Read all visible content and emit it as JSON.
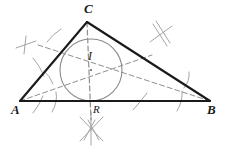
{
  "figure": {
    "background_color": "#ffffff"
  },
  "labels": {
    "vertex_a": "A",
    "vertex_b": "B",
    "vertex_c": "C",
    "incenter": "I",
    "foot_point": "R"
  },
  "colors": {
    "triangle_stroke": "#1a1a1a",
    "circle_stroke": "#8a8a8a",
    "bisector_stroke": "#8f8f8f",
    "construction_stroke": "#9a9a9a",
    "label_color": "#1a1a1a"
  },
  "geometry": {
    "points": {
      "A": [
        20,
        101
      ],
      "B": [
        210,
        101
      ],
      "C": [
        87,
        22
      ],
      "I": [
        91,
        70
      ],
      "R": [
        91,
        101
      ]
    },
    "incircle": {
      "center": [
        91,
        70
      ],
      "radius": 31
    },
    "bisectors": [
      {
        "from": "A",
        "to": [
          148,
          58
        ],
        "label": "bisector-from-a"
      },
      {
        "from": "B",
        "to": [
          42,
          44
        ],
        "label": "bisector-from-b"
      },
      {
        "from": "C",
        "to": [
          91,
          118
        ],
        "label": "bisector-from-c"
      }
    ]
  },
  "elements": {
    "triangle": "triangle-abc",
    "incircle": "incircle",
    "incenter_point": "incenter-point",
    "bisector_a": "angle-bisector-a",
    "bisector_b": "angle-bisector-b",
    "bisector_c": "angle-bisector-c",
    "arcs_at_a": "construction-arcs-a",
    "arcs_at_b": "construction-arcs-b",
    "arcs_at_c": "construction-arcs-c",
    "cross_left": "construction-cross-left",
    "cross_right": "construction-cross-right",
    "cross_bottom": "construction-cross-bottom"
  }
}
